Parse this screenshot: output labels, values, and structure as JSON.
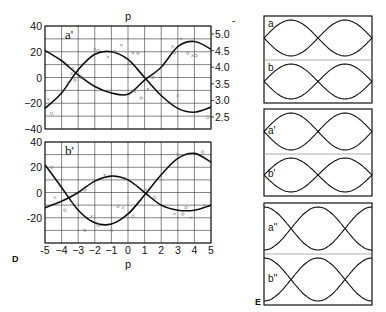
{
  "chart_data": [
    {
      "type": "line",
      "panel_letter": "D",
      "subplots": [
        {
          "label": "a'",
          "title": "p",
          "xlabel": "",
          "ylabel": "",
          "xlim": [
            -5,
            5
          ],
          "ylim": [
            -40,
            40
          ],
          "yticks": [
            "40",
            "20",
            "0",
            "−20",
            "−40"
          ],
          "ytick_values": [
            40,
            20,
            0,
            -20,
            -40
          ],
          "y2ticks": [
            "5.0",
            "4.5",
            "4.0",
            "3.5",
            "3.0",
            "2.5"
          ],
          "y2tick_values": [
            5.0,
            4.5,
            4.0,
            3.5,
            3.0,
            2.5
          ],
          "grid": true,
          "series": [
            {
              "name": "curve-1",
              "x": [
                -5,
                -4,
                -3,
                -2,
                -1,
                0,
                1,
                2,
                3,
                4,
                5
              ],
              "y": [
                21,
                13,
                2,
                -7,
                -12,
                -13,
                -2,
                8,
                24,
                28,
                22
              ]
            },
            {
              "name": "curve-2",
              "x": [
                -5,
                -4,
                -3,
                -2,
                -1,
                0,
                1,
                2,
                3,
                4,
                5
              ],
              "y": [
                -24,
                -12,
                6,
                18,
                20,
                14,
                0,
                -14,
                -24,
                -27,
                -23
              ]
            }
          ],
          "scatter_points": [
            {
              "x": -4.6,
              "y": -28
            },
            {
              "x": -4.8,
              "y": -17
            },
            {
              "x": -3.6,
              "y": -4
            },
            {
              "x": -3.4,
              "y": 3
            },
            {
              "x": -3.2,
              "y": -2
            },
            {
              "x": -3.3,
              "y": 7
            },
            {
              "x": -2.8,
              "y": 0
            },
            {
              "x": -2,
              "y": 22
            },
            {
              "x": -1.8,
              "y": 21
            },
            {
              "x": -1.2,
              "y": 16
            },
            {
              "x": -0.8,
              "y": 20
            },
            {
              "x": -0.4,
              "y": 25
            },
            {
              "x": 0.1,
              "y": 11
            },
            {
              "x": 0.3,
              "y": 19
            },
            {
              "x": 0.6,
              "y": 19
            },
            {
              "x": 0.4,
              "y": -11
            },
            {
              "x": 0.8,
              "y": -16
            },
            {
              "x": 1.2,
              "y": -9
            },
            {
              "x": 1.5,
              "y": 0
            },
            {
              "x": 2.7,
              "y": 24
            },
            {
              "x": 2.8,
              "y": 19
            },
            {
              "x": 3.2,
              "y": 30
            },
            {
              "x": 3.6,
              "y": 19
            },
            {
              "x": 3.9,
              "y": 17
            },
            {
              "x": 4.1,
              "y": 17
            },
            {
              "x": 3.0,
              "y": -14
            },
            {
              "x": 4.8,
              "y": -31
            }
          ]
        },
        {
          "label": "b'",
          "xlabel": "p",
          "ylabel": "",
          "xlim": [
            -5,
            5
          ],
          "ylim": [
            -40,
            40
          ],
          "yticks": [
            "40",
            "20",
            "0",
            "-20"
          ],
          "ytick_values": [
            40,
            20,
            0,
            -20
          ],
          "xticks": [
            "-5",
            "−4",
            "−3",
            "−2",
            "−1",
            "0",
            "1",
            "2",
            "3",
            "4",
            "5"
          ],
          "xtick_values": [
            -5,
            -4,
            -3,
            -2,
            -1,
            0,
            1,
            2,
            3,
            4,
            5
          ],
          "grid": true,
          "series": [
            {
              "name": "curve-1",
              "x": [
                -5,
                -4,
                -3,
                -2,
                -1,
                0,
                1,
                2,
                3,
                4,
                5
              ],
              "y": [
                22,
                4,
                -14,
                -24,
                -25,
                -17,
                -2,
                14,
                27,
                31,
                24
              ]
            },
            {
              "name": "curve-2",
              "x": [
                -5,
                -4,
                -3,
                -2,
                -1,
                0,
                1,
                2,
                3,
                4,
                5
              ],
              "y": [
                -12,
                -7,
                0,
                9,
                13,
                10,
                0,
                -10,
                -14,
                -14,
                -10
              ]
            }
          ],
          "scatter_points": [
            {
              "x": -4.6,
              "y": 20
            },
            {
              "x": -4.4,
              "y": -4
            },
            {
              "x": -3.8,
              "y": -14
            },
            {
              "x": -3.4,
              "y": -8
            },
            {
              "x": -2.6,
              "y": 2
            },
            {
              "x": -2.2,
              "y": -19
            },
            {
              "x": -1.8,
              "y": -26
            },
            {
              "x": -1.4,
              "y": 14
            },
            {
              "x": -2.6,
              "y": -30
            },
            {
              "x": -1.0,
              "y": -30
            },
            {
              "x": -0.6,
              "y": -11
            },
            {
              "x": -0.3,
              "y": -12
            },
            {
              "x": -0.2,
              "y": 11
            },
            {
              "x": 0.5,
              "y": 6
            },
            {
              "x": 0.3,
              "y": -19
            },
            {
              "x": 1.1,
              "y": 2
            },
            {
              "x": 1.6,
              "y": -4
            },
            {
              "x": 2.8,
              "y": -17
            },
            {
              "x": 3.3,
              "y": -17
            },
            {
              "x": 3.0,
              "y": 30
            },
            {
              "x": 3.5,
              "y": -12
            },
            {
              "x": 3.8,
              "y": -20
            },
            {
              "x": 4.5,
              "y": 32
            },
            {
              "x": 4.6,
              "y": -10
            }
          ]
        }
      ]
    },
    {
      "type": "line",
      "panel_letter": "E",
      "groups": [
        {
          "panels": [
            {
              "label": "a",
              "phase": 0,
              "markers_top": [
                "o",
                "x"
              ],
              "markers_bottom": [
                "x",
                "o"
              ]
            },
            {
              "label": "b",
              "phase": 0,
              "markers_top": [
                "o",
                "x"
              ],
              "markers_bottom": [
                "x",
                "o"
              ]
            }
          ]
        },
        {
          "panels": [
            {
              "label": "a'",
              "phase": 0.5,
              "markers_top": [
                "x"
              ],
              "markers_bottom": [
                "o"
              ]
            },
            {
              "label": "b'",
              "phase": 0.5,
              "markers_top": [
                "o"
              ],
              "markers_bottom": [
                "x"
              ]
            }
          ]
        },
        {
          "panels": [
            {
              "label": "a''",
              "phase": 0.25,
              "markers_top": [
                "o",
                "x"
              ],
              "markers_bottom": [
                "x",
                "o"
              ]
            },
            {
              "label": "b''",
              "phase": 0.75,
              "markers_top": [
                "o",
                "x"
              ],
              "markers_bottom": [
                "x",
                "o"
              ]
            }
          ]
        }
      ]
    }
  ],
  "labels": {
    "fig_d": "D",
    "fig_e": "E",
    "top_title": "p",
    "bottom_xlabel": "p",
    "stray_mark": "-"
  }
}
